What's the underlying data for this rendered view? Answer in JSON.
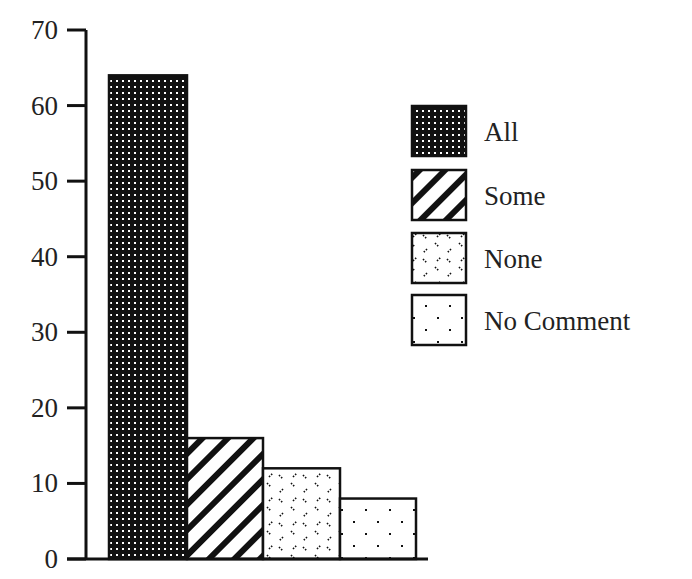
{
  "chart_data": {
    "type": "bar",
    "title": "",
    "xlabel": "",
    "ylabel": "",
    "categories": [
      "All",
      "Some",
      "None",
      "No Comment"
    ],
    "values": [
      64,
      16,
      12,
      8
    ],
    "ylim": [
      0,
      70
    ],
    "yticks": [
      0,
      10,
      20,
      30,
      40,
      50,
      60,
      70
    ],
    "grid": false,
    "legend_position": "right",
    "legend": [
      {
        "label": "All",
        "pattern": "dense-dots-on-black"
      },
      {
        "label": "Some",
        "pattern": "diagonal-stripes"
      },
      {
        "label": "None",
        "pattern": "scattered-dashes"
      },
      {
        "label": "No Comment",
        "pattern": "sparse-dots"
      }
    ],
    "colors": {
      "ink": "#111111",
      "background": "#ffffff"
    }
  }
}
